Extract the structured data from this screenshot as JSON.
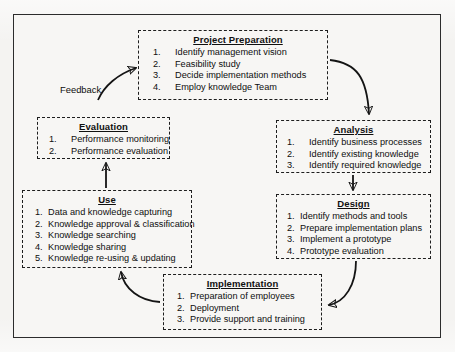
{
  "diagram": {
    "frame_color": "#2c2c2c",
    "box_border_color": "#1d1d1d",
    "arrow_color": "#141414",
    "background_color": "#f4f3f1",
    "boxes": [
      {
        "id": "project-preparation",
        "title": "Project Preparation",
        "items": [
          {
            "num": "1.",
            "text": "Identify management vision"
          },
          {
            "num": "2.",
            "text": "Feasibility study"
          },
          {
            "num": "3.",
            "text": "Decide implementation methods"
          },
          {
            "num": "4.",
            "text": "Employ knowledge Team"
          }
        ]
      },
      {
        "id": "analysis",
        "title": "Analysis",
        "items": [
          {
            "num": "1.",
            "text": "Identify business processes"
          },
          {
            "num": "2.",
            "text": "Identify existing knowledge"
          },
          {
            "num": "3.",
            "text": "Identify required knowledge"
          }
        ]
      },
      {
        "id": "design",
        "title": "Design",
        "items": [
          {
            "num": "1.",
            "text": "Identify methods and tools"
          },
          {
            "num": "2.",
            "text": "Prepare implementation plans"
          },
          {
            "num": "3.",
            "text": "Implement a prototype"
          },
          {
            "num": "4.",
            "text": "Prototype evaluation"
          }
        ]
      },
      {
        "id": "implementation",
        "title": "Implementation",
        "items": [
          {
            "num": "1.",
            "text": "Preparation of employees"
          },
          {
            "num": "2.",
            "text": "Deployment"
          },
          {
            "num": "3.",
            "text": "Provide support and training"
          }
        ]
      },
      {
        "id": "use",
        "title": "Use",
        "items": [
          {
            "num": "1.",
            "text": "Data and knowledge capturing"
          },
          {
            "num": "2.",
            "text": "Knowledge approval & classification"
          },
          {
            "num": "3.",
            "text": "Knowledge searching"
          },
          {
            "num": "4.",
            "text": "Knowledge sharing"
          },
          {
            "num": "5.",
            "text": "Knowledge re-using & updating"
          }
        ]
      },
      {
        "id": "evaluation",
        "title": "Evaluation",
        "items": [
          {
            "num": "1.",
            "text": "Performance monitoring"
          },
          {
            "num": "2.",
            "text": "Performance evaluation"
          }
        ]
      }
    ],
    "connectors": [
      {
        "id": "pp-to-analysis",
        "from": "project-preparation",
        "to": "analysis",
        "style": "curved",
        "label": ""
      },
      {
        "id": "analysis-to-design",
        "from": "analysis",
        "to": "design",
        "style": "straight",
        "label": ""
      },
      {
        "id": "design-to-implementation",
        "from": "design",
        "to": "implementation",
        "style": "curved",
        "label": ""
      },
      {
        "id": "implementation-to-use",
        "from": "implementation",
        "to": "use",
        "style": "curved",
        "label": ""
      },
      {
        "id": "use-to-evaluation",
        "from": "use",
        "to": "evaluation",
        "style": "straight",
        "label": ""
      },
      {
        "id": "evaluation-to-pp",
        "from": "evaluation",
        "to": "project-preparation",
        "style": "curved",
        "label": "Feedback"
      }
    ],
    "feedback_label": "Feedback"
  }
}
